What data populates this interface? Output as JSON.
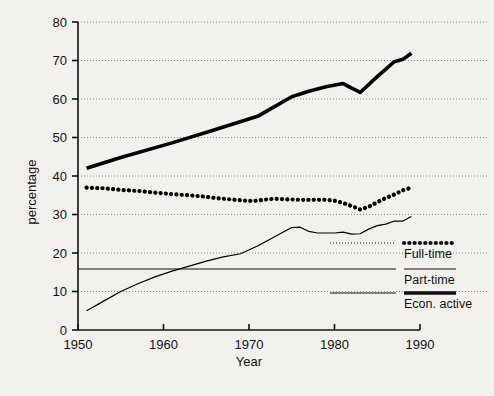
{
  "chart_data": {
    "type": "line",
    "title": "",
    "xlabel": "Year",
    "ylabel": "percentage",
    "xlim": [
      1950,
      1990
    ],
    "ylim": [
      0,
      80
    ],
    "xticks": [
      1950,
      1960,
      1970,
      1980,
      1990
    ],
    "yticks": [
      0,
      10,
      20,
      30,
      40,
      50,
      60,
      70,
      80
    ],
    "xtick_labels": [
      "1950",
      "1960",
      "1970",
      "1980",
      "1990"
    ],
    "ytick_labels": [
      "0",
      "10",
      "20",
      "30",
      "40",
      "50",
      "60",
      "70",
      "80"
    ],
    "grid": "horizontal-dotted",
    "legend_position": "right-outside",
    "series": [
      {
        "name": "Full-time",
        "style": "dotted-thick",
        "color": "#000000",
        "x": [
          1951,
          1953,
          1955,
          1957,
          1959,
          1961,
          1963,
          1965,
          1966,
          1967,
          1968,
          1969,
          1970,
          1971,
          1972,
          1973,
          1974,
          1975,
          1976,
          1977,
          1978,
          1979,
          1980,
          1981,
          1982,
          1983,
          1984,
          1985,
          1986,
          1987,
          1988,
          1989
        ],
        "values": [
          37.0,
          36.8,
          36.4,
          36.1,
          35.7,
          35.3,
          35.0,
          34.6,
          34.3,
          34.1,
          33.9,
          33.7,
          33.5,
          33.6,
          33.9,
          34.1,
          34.0,
          33.9,
          33.8,
          33.8,
          33.8,
          33.8,
          33.6,
          33.0,
          32.2,
          31.3,
          32.0,
          33.2,
          34.3,
          35.2,
          36.3,
          37.0
        ]
      },
      {
        "name": "Part-time",
        "style": "thin-solid",
        "color": "#000000",
        "x": [
          1951,
          1953,
          1955,
          1957,
          1959,
          1961,
          1963,
          1965,
          1967,
          1969,
          1971,
          1973,
          1975,
          1976,
          1977,
          1978,
          1979,
          1980,
          1981,
          1982,
          1983,
          1984,
          1985,
          1986,
          1987,
          1988,
          1989
        ],
        "values": [
          5.0,
          7.5,
          10.0,
          12.0,
          13.8,
          15.3,
          16.6,
          17.9,
          19.0,
          19.8,
          21.8,
          24.2,
          26.6,
          26.7,
          25.6,
          25.2,
          25.2,
          25.2,
          25.4,
          24.9,
          25.0,
          26.2,
          27.1,
          27.5,
          28.3,
          28.3,
          29.5
        ]
      },
      {
        "name": "Econ. active",
        "style": "thick-solid",
        "color": "#000000",
        "x": [
          1951,
          1955,
          1961,
          1966,
          1971,
          1975,
          1977,
          1979,
          1981,
          1983,
          1985,
          1987,
          1988,
          1989
        ],
        "values": [
          42.0,
          44.8,
          48.6,
          52.0,
          55.5,
          60.6,
          62.0,
          63.2,
          64.0,
          61.7,
          65.8,
          69.7,
          70.3,
          71.9
        ]
      }
    ],
    "legend_entries": [
      {
        "label": "Full-time",
        "style": "dotted-thick"
      },
      {
        "label": "Part-time",
        "style": "thin-solid"
      },
      {
        "label": "Econ. active",
        "style": "thick-solid"
      }
    ]
  },
  "colors": {
    "background": "#f2f1ee",
    "ink": "#111111",
    "grid": "#888888"
  }
}
